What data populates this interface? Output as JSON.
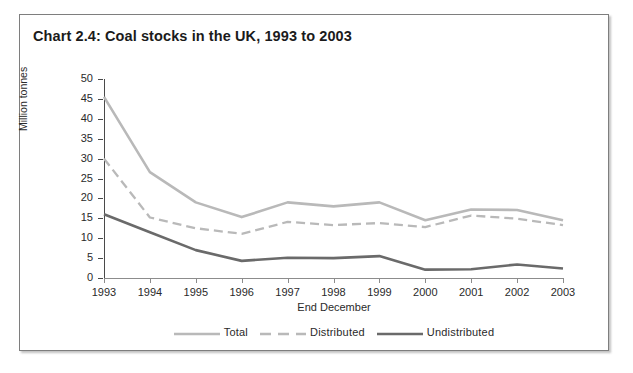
{
  "chart_data": {
    "type": "line",
    "title": "Chart 2.4: Coal stocks in the UK, 1993 to 2003",
    "xlabel": "End December",
    "ylabel": "Million tonnes",
    "categories": [
      "1993",
      "1994",
      "1995",
      "1996",
      "1997",
      "1998",
      "1999",
      "2000",
      "2001",
      "2002",
      "2003"
    ],
    "x": [
      1993,
      1994,
      1995,
      1996,
      1997,
      1998,
      1999,
      2000,
      2001,
      2002,
      2003
    ],
    "series": [
      {
        "name": "Total",
        "color": "#b9b9b9",
        "style": "solid",
        "values": [
          45.5,
          26.6,
          19.0,
          15.3,
          19.0,
          18.0,
          19.0,
          14.5,
          17.2,
          17.1,
          14.5
        ]
      },
      {
        "name": "Distributed",
        "color": "#b9b9b9",
        "style": "dashed",
        "values": [
          30.0,
          15.2,
          12.5,
          11.1,
          14.1,
          13.3,
          13.8,
          12.8,
          15.7,
          14.9,
          13.3
        ]
      },
      {
        "name": "Undistributed",
        "color": "#6a6a6a",
        "style": "solid",
        "values": [
          16.0,
          11.5,
          7.0,
          4.3,
          5.1,
          5.0,
          5.5,
          2.1,
          2.2,
          3.4,
          2.4
        ]
      }
    ],
    "ylim": [
      0,
      50
    ],
    "yticks": [
      0,
      5,
      10,
      15,
      20,
      25,
      30,
      35,
      40,
      45,
      50
    ],
    "ytick_labels": [
      "0",
      "5",
      "10",
      "15",
      "20",
      "25",
      "30",
      "35",
      "40",
      "45",
      "50"
    ],
    "grid": false,
    "legend_position": "bottom"
  },
  "legend": {
    "entries": [
      {
        "label": "Total"
      },
      {
        "label": "Distributed"
      },
      {
        "label": "Undistributed"
      }
    ]
  }
}
